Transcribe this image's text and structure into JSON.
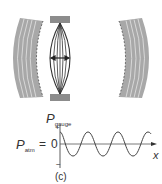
{
  "figure": {
    "caption": "(c)",
    "graph": {
      "y_label_main": "P",
      "y_label_sub": "gauge",
      "y_tick_plus": "+",
      "y_tick_minus": "−",
      "baseline_label_main": "P",
      "baseline_label_sub": "atm",
      "baseline_equals": "=",
      "baseline_value": "0",
      "x_label": "x"
    },
    "colors": {
      "wavefront_gray": "#9a9a9a",
      "clamp_gray": "#8c8c8c",
      "line": "#333333"
    }
  }
}
